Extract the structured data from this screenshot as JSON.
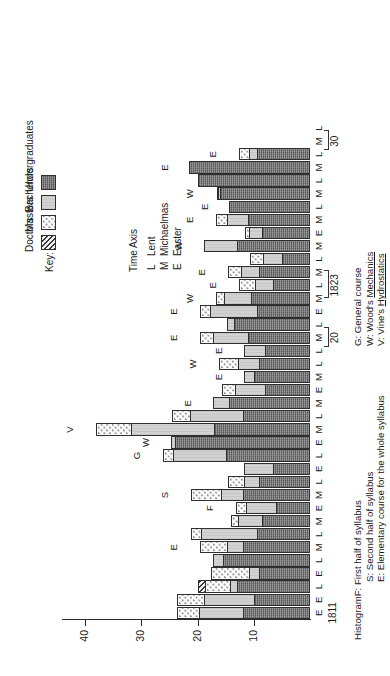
{
  "chart_data": {
    "type": "bar",
    "orientation": "stacked-vertical-rotated",
    "title": "",
    "xlabel": "",
    "ylabel": "",
    "ylim": [
      0,
      42
    ],
    "yticks": [
      10,
      20,
      30,
      40
    ],
    "grid": false,
    "legend_position": "right",
    "series": [
      {
        "name": "Undergraduates",
        "key": "u"
      },
      {
        "name": "Bachelors",
        "key": "b"
      },
      {
        "name": "Masters",
        "key": "m"
      },
      {
        "name": "Doctors",
        "key": "d"
      }
    ],
    "categories": [
      "E",
      "E",
      "L",
      "E",
      "L",
      "M",
      "L",
      "M",
      "E",
      "M",
      "L",
      "E",
      "L",
      "E",
      "M",
      "L",
      "M",
      "E",
      "M",
      "L",
      "L",
      "M",
      "L",
      "E",
      "M",
      "L",
      "M",
      "L",
      "M",
      "E",
      "M",
      "L",
      "M",
      "L",
      "M",
      "L",
      "M",
      "L"
    ],
    "points": [
      {
        "term": "E",
        "u": 12.0,
        "b": 8.0,
        "m": 4.0,
        "d": 0.0,
        "course": ""
      },
      {
        "term": "E",
        "u": 10.0,
        "b": 9.0,
        "m": 5.0,
        "d": 0.0,
        "course": ""
      },
      {
        "term": "L",
        "u": 13.0,
        "b": 1.5,
        "m": 4.5,
        "d": 1.5,
        "course": ""
      },
      {
        "term": "E",
        "u": 9.0,
        "b": 2.0,
        "m": 7.0,
        "d": 0.0,
        "course": ""
      },
      {
        "term": "L",
        "u": 15.5,
        "b": 2.0,
        "m": 0.0,
        "d": 0.0,
        "course": ""
      },
      {
        "term": "M",
        "u": 12.0,
        "b": 3.0,
        "m": 5.0,
        "d": 0.0,
        "course": "E"
      },
      {
        "term": "L",
        "u": 9.5,
        "b": 10.0,
        "m": 2.0,
        "d": 0.0,
        "course": ""
      },
      {
        "term": "M",
        "u": 8.5,
        "b": 4.5,
        "m": 1.5,
        "d": 0.0,
        "course": ""
      },
      {
        "term": "E",
        "u": 6.0,
        "b": 5.5,
        "m": 2.0,
        "d": 0.0,
        "course": "F"
      },
      {
        "term": "M",
        "u": 12.0,
        "b": 4.0,
        "m": 5.5,
        "d": 0.0,
        "course": "S"
      },
      {
        "term": "L",
        "u": 9.0,
        "b": 3.0,
        "m": 3.0,
        "d": 0.0,
        "course": ""
      },
      {
        "term": "E",
        "u": 6.5,
        "b": 5.5,
        "m": 0.0,
        "d": 0.0,
        "course": ""
      },
      {
        "term": "L",
        "u": 15.0,
        "b": 9.5,
        "m": 2.0,
        "d": 0.0,
        "course": "G"
      },
      {
        "term": "E",
        "u": 24.0,
        "b": 1.0,
        "m": 0.0,
        "d": 0.0,
        "course": "W"
      },
      {
        "term": "M",
        "u": 17.0,
        "b": 15.0,
        "m": 6.5,
        "d": 0.0,
        "course": "V"
      },
      {
        "term": "L",
        "u": 12.0,
        "b": 9.5,
        "m": 3.5,
        "d": 0.0,
        "course": ""
      },
      {
        "term": "M",
        "u": 14.5,
        "b": 3.0,
        "m": 0.0,
        "d": 0.0,
        "course": "E"
      },
      {
        "term": "E",
        "u": 8.0,
        "b": 5.5,
        "m": 2.5,
        "d": 0.0,
        "course": ""
      },
      {
        "term": "M",
        "u": 10.0,
        "b": 2.0,
        "m": 0.0,
        "d": 0.0,
        "course": "E"
      },
      {
        "term": "L",
        "u": 9.0,
        "b": 4.0,
        "m": 3.5,
        "d": 0.0,
        "course": "W"
      },
      {
        "term": "L",
        "u": 8.0,
        "b": 4.0,
        "m": 0.0,
        "d": 0.0,
        "course": "E"
      },
      {
        "term": "M",
        "u": 11.0,
        "b": 6.5,
        "m": 2.5,
        "d": 0.0,
        "course": "E"
      },
      {
        "term": "L",
        "u": 13.5,
        "b": 1.5,
        "m": 0.0,
        "d": 0.0,
        "course": ""
      },
      {
        "term": "E",
        "u": 9.5,
        "b": 8.5,
        "m": 2.0,
        "d": 0.0,
        "course": "E"
      },
      {
        "term": "M",
        "u": 10.5,
        "b": 5.0,
        "m": 1.5,
        "d": 0.0,
        "course": "W"
      },
      {
        "term": "L",
        "u": 6.5,
        "b": 3.5,
        "m": 3.0,
        "d": 0.0,
        "course": "E"
      },
      {
        "term": "M",
        "u": 9.0,
        "b": 3.5,
        "m": 2.5,
        "d": 0.0,
        "course": "E"
      },
      {
        "term": "L",
        "u": 5.0,
        "b": 3.5,
        "m": 2.5,
        "d": 0.0,
        "course": ""
      },
      {
        "term": "M",
        "u": 13.0,
        "b": 6.0,
        "m": 0.0,
        "d": 0.0,
        "course": "W"
      },
      {
        "term": "E",
        "u": 8.5,
        "b": 2.5,
        "m": 1.0,
        "d": 0.0,
        "course": ""
      },
      {
        "term": "M",
        "u": 11.0,
        "b": 4.0,
        "m": 2.0,
        "d": 0.0,
        "course": "E"
      },
      {
        "term": "L",
        "u": 14.5,
        "b": 0.0,
        "m": 0.0,
        "d": 0.0,
        "course": "E"
      },
      {
        "term": "M",
        "u": 16.0,
        "b": 0.5,
        "m": 0.5,
        "d": 0.0,
        "course": "W"
      },
      {
        "term": "L",
        "u": 20.0,
        "b": 0.0,
        "m": 0.0,
        "d": 0.0,
        "course": ""
      },
      {
        "term": "M",
        "u": 21.5,
        "b": 0.0,
        "m": 0.0,
        "d": 0.0,
        "course": "E"
      },
      {
        "term": "L",
        "u": 9.5,
        "b": 1.5,
        "m": 2.0,
        "d": 0.0,
        "course": "E"
      },
      {
        "term": "M",
        "u": 0.0,
        "b": 0.0,
        "m": 0.0,
        "d": 0.0,
        "course": ""
      },
      {
        "term": "L",
        "u": 0.0,
        "b": 0.0,
        "m": 0.0,
        "d": 0.0,
        "course": ""
      }
    ],
    "year_markers": [
      {
        "label": "1811",
        "index": 0
      },
      {
        "label": "20",
        "index": 21
      },
      {
        "label": "1823",
        "index": 25
      },
      {
        "label": "30",
        "index": 36
      }
    ]
  },
  "key": {
    "title": "Key:",
    "items": [
      {
        "label": "Doctors",
        "swatch": "hatch-swatch"
      },
      {
        "label": "Masters",
        "swatch": "dots-swatch"
      },
      {
        "label": "Bachelors",
        "swatch": "light-swatch"
      },
      {
        "label": "Undergraduates",
        "swatch": "dark-swatch"
      }
    ]
  },
  "time_axis": {
    "title": "Time Axis",
    "items": [
      {
        "letter": "L",
        "word": "Lent"
      },
      {
        "letter": "M",
        "word": "Michaelmas"
      },
      {
        "letter": "E",
        "word": "Easter"
      }
    ]
  },
  "notes": {
    "histogram_word": "Histogram",
    "left": [
      "F: First half of syllabus",
      "S: Second half of syllabus",
      "E: Elementary course for the whole syllabus"
    ],
    "right": [
      "G: General course",
      "W: Wood's Mechanics",
      "V: Vine's Hydrostatics"
    ]
  },
  "axis": {
    "ticks": [
      "40",
      "30",
      "20",
      "10"
    ]
  },
  "colors": {
    "undergraduates": "#6e6e6e",
    "bachelors": "#d2d2d2",
    "masters": "#fbfbfb",
    "doctors": "#9a9a9a",
    "ink": "#1a1a1a",
    "background": "#ffffff"
  }
}
